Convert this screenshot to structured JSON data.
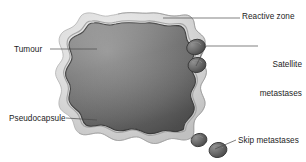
{
  "figure": {
    "background_color": "#ffffff",
    "label_color": "#1c1c1c",
    "leader_line_color": "#4a4a4a",
    "colors": {
      "tumour_core_light": "#8d8d8d",
      "tumour_core_mid": "#747474",
      "tumour_core_dark": "#575757",
      "tumour_outline": "#3d3d3d",
      "reactive_zone_light": "#e4e4e4",
      "reactive_zone_mid": "#cfcfcf",
      "reactive_zone_shadow": "#b4b4b4",
      "pseudocapsule_line": "#9a9a9a",
      "nodule_light": "#8a8a8a",
      "nodule_dark": "#4e4e4e",
      "nodule_outline": "#3a3a3a"
    },
    "labels": {
      "tumour": "Tumour",
      "pseudocapsule": "Pseudocapsule",
      "reactive_zone": "Reactive zone",
      "satellite_line1": "Satellite",
      "satellite_line2": "metastases",
      "skip_metastases": "Skip metastases"
    },
    "structures": {
      "tumour_core": "tumour-core-mass",
      "reactive_zone": "reactive-zone-rim",
      "pseudocapsule": "pseudocapsule-boundary",
      "satellite_nodule_upper": "satellite-nodule-1",
      "satellite_nodule_lower": "satellite-nodule-2",
      "skip_nodule_left": "skip-nodule-1",
      "skip_nodule_right": "skip-nodule-2"
    }
  }
}
